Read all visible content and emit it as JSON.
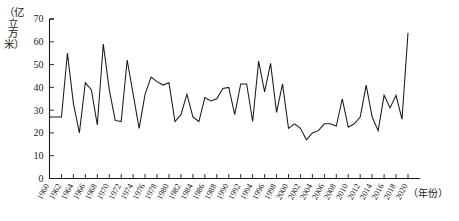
{
  "chart_data": {
    "type": "line",
    "title": "",
    "subtitle": "",
    "xlabel": "（年份）",
    "ylabel": "（亿立方米）",
    "ylim": [
      0,
      70
    ],
    "xlim": [
      1960,
      2020
    ],
    "y_ticks": [
      0,
      10,
      20,
      30,
      40,
      50,
      60,
      70
    ],
    "x_ticks": [
      1960,
      1962,
      1964,
      1966,
      1968,
      1970,
      1972,
      1974,
      1976,
      1978,
      1980,
      1982,
      1984,
      1986,
      1988,
      1990,
      1992,
      1994,
      1996,
      1998,
      2000,
      2002,
      2004,
      2006,
      2008,
      2010,
      2012,
      2014,
      2016,
      2018,
      2020
    ],
    "grid": false,
    "legend": false,
    "legend_position": "none",
    "line_color": "#1a1a1a",
    "series": [
      {
        "name": "年径流量",
        "x": [
          1960,
          1961,
          1962,
          1963,
          1964,
          1965,
          1966,
          1967,
          1968,
          1969,
          1970,
          1971,
          1972,
          1973,
          1974,
          1975,
          1976,
          1977,
          1978,
          1979,
          1980,
          1981,
          1982,
          1983,
          1984,
          1985,
          1986,
          1987,
          1988,
          1989,
          1990,
          1991,
          1992,
          1993,
          1994,
          1995,
          1996,
          1997,
          1998,
          1999,
          2000,
          2001,
          2002,
          2003,
          2004,
          2005,
          2006,
          2007,
          2008,
          2009,
          2010,
          2011,
          2012,
          2013,
          2014,
          2015,
          2016,
          2017,
          2018,
          2019,
          2020
        ],
        "values": [
          27,
          27,
          27,
          55,
          33,
          20,
          42,
          39,
          23.5,
          59,
          39,
          25.5,
          25,
          52,
          37,
          22,
          37,
          44.5,
          42.5,
          41,
          42,
          25,
          28,
          37,
          27,
          25,
          35.5,
          34,
          35,
          39.5,
          40,
          28,
          41.5,
          41.5,
          25,
          51.5,
          38,
          50.5,
          29,
          41.5,
          22,
          24,
          22,
          17,
          20,
          21,
          24,
          24,
          23,
          35,
          22.5,
          24,
          27,
          41,
          27,
          21,
          36.5,
          31,
          36.5,
          26,
          64
        ]
      }
    ]
  },
  "axis": {
    "y_unit_label": "（亿立方米）",
    "x_unit_label": "（年份）"
  }
}
